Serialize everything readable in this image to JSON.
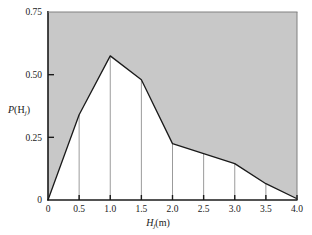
{
  "chart_data": {
    "type": "area",
    "title": "",
    "subtitle": "",
    "xlabel": "Hj(m)",
    "xlabel_parts": {
      "symbol": "H",
      "subscript": "j",
      "unit": "(m)"
    },
    "ylabel": "P(Hj)",
    "ylabel_parts": {
      "symbol": "P",
      "open": "(H",
      "subscript": "j",
      "close": ")"
    },
    "x": [
      0,
      0.5,
      1.0,
      1.5,
      2.0,
      2.5,
      3.0,
      3.5,
      4.0
    ],
    "values": [
      0.0,
      0.34,
      0.575,
      0.48,
      0.225,
      0.185,
      0.145,
      0.065,
      0.005
    ],
    "series": [
      {
        "name": "P(Hj)",
        "values": [
          0.0,
          0.34,
          0.575,
          0.48,
          0.225,
          0.185,
          0.145,
          0.065,
          0.005
        ]
      }
    ],
    "xlim": [
      0,
      4.0
    ],
    "ylim": [
      0,
      0.75
    ],
    "xticks": [
      0,
      0.5,
      1.0,
      1.5,
      2.0,
      2.5,
      3.0,
      3.5,
      4.0
    ],
    "xtick_labels": [
      "0",
      "0.5",
      "1.0",
      "1.5",
      "2.0",
      "2.5",
      "3.0",
      "3.5",
      "4.0"
    ],
    "yticks": [
      0,
      0.25,
      0.5,
      0.75
    ],
    "ytick_labels": [
      "0",
      "0.25",
      "0.50",
      "0.75"
    ],
    "grid": false,
    "legend": "none",
    "fill_above_curve": true,
    "drop_lines": true,
    "colors": {
      "fill_above": "#c8c8c8",
      "fill_below": "#ffffff",
      "curve": "#1a1a1a",
      "axis": "#1a1a1a",
      "drop_line": "#909090",
      "text": "#1a1a1a"
    }
  },
  "plot_geometry": {
    "left": 48,
    "right": 297,
    "top": 12,
    "bottom": 200
  }
}
